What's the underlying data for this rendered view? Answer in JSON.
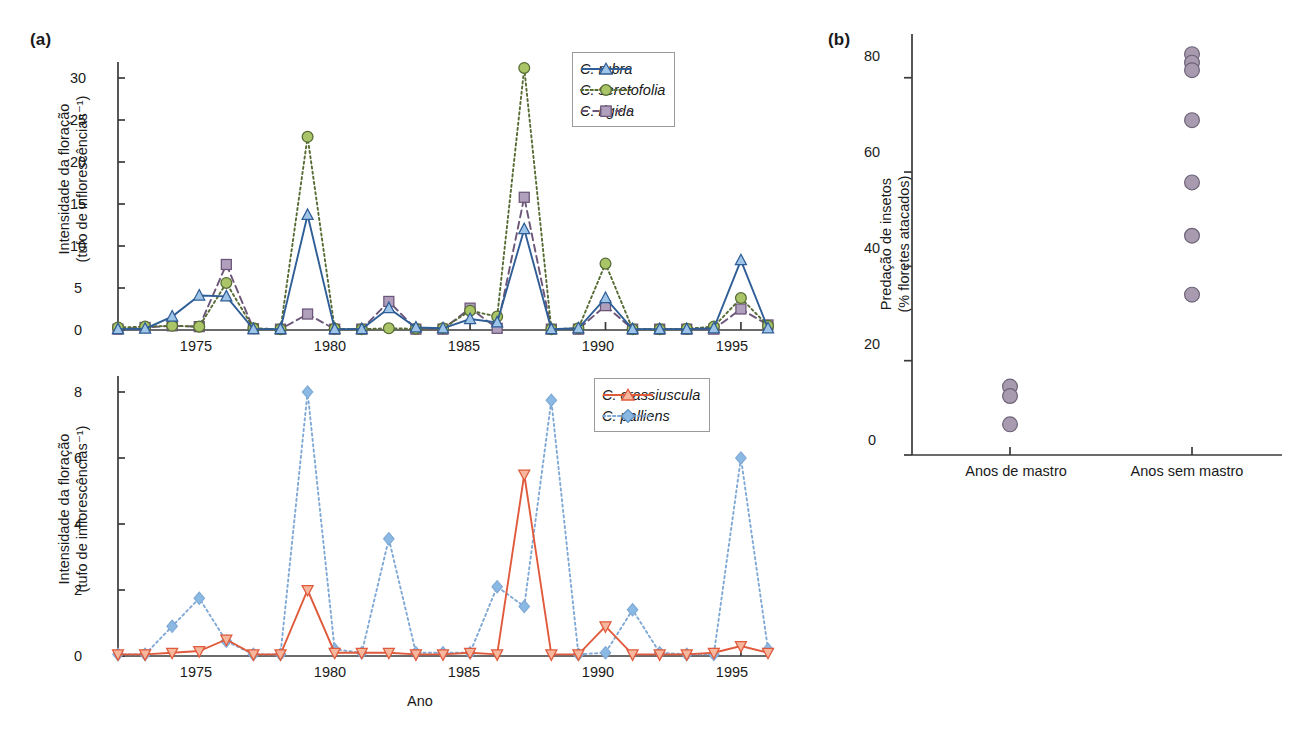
{
  "figure": {
    "panel_a_tag": "(a)",
    "panel_b_tag": "(b)"
  },
  "panel_a_top": {
    "ylabel_line1": "Intensidade da floração",
    "ylabel_line2": "(tufo de inflorescências⁻¹)",
    "yticks": [
      "0",
      "5",
      "10",
      "15",
      "20",
      "25",
      "30"
    ],
    "xticks": [
      "1975",
      "1980",
      "1985",
      "1990",
      "1995"
    ],
    "legend": [
      {
        "label": "C. rubra",
        "key": "line-solid-triangle-blue"
      },
      {
        "label": "C. seretofolia",
        "key": "line-dotted-circle-green"
      },
      {
        "label": "C. rigida",
        "key": "line-dashed-square-purple"
      }
    ]
  },
  "panel_a_bottom": {
    "ylabel_line1": "Intensidade da floração",
    "ylabel_line2": "(tufo de inflorescências⁻¹)",
    "yticks": [
      "0",
      "2",
      "4",
      "6",
      "8"
    ],
    "xticks": [
      "1975",
      "1980",
      "1985",
      "1990",
      "1995"
    ],
    "xlabel": "Ano",
    "legend": [
      {
        "label": "C. crassiuscula",
        "key": "line-solid-triangle-orange"
      },
      {
        "label": "C. palliens",
        "key": "line-dotted-diamond-blue"
      }
    ]
  },
  "panel_b": {
    "ylabel_line1": "Predação de insetos",
    "ylabel_line2": "(% floretes atacados)",
    "yticks": [
      "0",
      "20",
      "40",
      "60",
      "80"
    ],
    "xticks": [
      "Anos de mastro",
      "Anos sem mastro"
    ]
  },
  "colors": {
    "rubra_line": "#2f5d96",
    "rubra_marker": "#9ec4e8",
    "seretofolia_line": "#566b33",
    "seretofolia_marker": "#aac468",
    "rigida_line": "#6b5578",
    "rigida_marker": "#b0a0bd",
    "crassiuscula_line": "#e05a3c",
    "crassiuscula_marker": "#f6b79c",
    "palliens_line": "#7fa8d4",
    "palliens_marker": "#8ab9e4",
    "predation_marker": "#a89bb0",
    "axis": "#3a3a3a"
  },
  "chart_data": [
    {
      "id": "panel-a-top",
      "type": "line",
      "title": "",
      "xlabel": "",
      "ylabel": "Intensidade da floração (tufo de inflorescências-1)",
      "xlim": [
        1972,
        1996
      ],
      "ylim": [
        0,
        32
      ],
      "grid": false,
      "legend_position": "top-right",
      "x": [
        1972,
        1973,
        1974,
        1975,
        1976,
        1977,
        1978,
        1979,
        1980,
        1981,
        1982,
        1983,
        1984,
        1985,
        1986,
        1987,
        1988,
        1989,
        1990,
        1991,
        1992,
        1993,
        1994,
        1995,
        1996
      ],
      "series": [
        {
          "name": "C. rubra",
          "values": [
            0.1,
            0.15,
            1.6,
            4.1,
            4.0,
            0.1,
            0.1,
            13.7,
            0.1,
            0.1,
            2.6,
            0.3,
            0.2,
            1.3,
            0.9,
            12.0,
            0.1,
            0.2,
            3.8,
            0.1,
            0.1,
            0.1,
            0.2,
            8.3,
            0.2
          ]
        },
        {
          "name": "C. seretofolia",
          "values": [
            0.3,
            0.4,
            0.5,
            0.4,
            5.6,
            0.2,
            0.1,
            23.0,
            0.15,
            0.1,
            0.2,
            0.15,
            0.2,
            2.3,
            1.6,
            31.2,
            0.1,
            0.2,
            7.9,
            0.1,
            0.1,
            0.15,
            0.4,
            3.8,
            0.5
          ]
        },
        {
          "name": "C. rigida",
          "values": [
            0.1,
            0.3,
            0.5,
            0.4,
            7.8,
            0.15,
            0.1,
            1.9,
            0.1,
            0.1,
            3.4,
            0.1,
            0.1,
            2.6,
            0.2,
            15.8,
            0.1,
            0.1,
            2.9,
            0.1,
            0.1,
            0.1,
            0.1,
            2.5,
            0.6
          ]
        }
      ]
    },
    {
      "id": "panel-a-bottom",
      "type": "line",
      "title": "",
      "xlabel": "Ano",
      "ylabel": "Intensidade da floração (tufo de inflorescências-1)",
      "xlim": [
        1972,
        1996
      ],
      "ylim": [
        0,
        9
      ],
      "grid": false,
      "legend_position": "top-right",
      "x": [
        1972,
        1973,
        1974,
        1975,
        1976,
        1977,
        1978,
        1979,
        1980,
        1981,
        1982,
        1983,
        1984,
        1985,
        1986,
        1987,
        1988,
        1989,
        1990,
        1991,
        1992,
        1993,
        1994,
        1995,
        1996
      ],
      "series": [
        {
          "name": "C. crassiuscula",
          "values": [
            0.05,
            0.05,
            0.1,
            0.15,
            0.5,
            0.05,
            0.05,
            2.0,
            0.1,
            0.1,
            0.1,
            0.05,
            0.05,
            0.1,
            0.05,
            5.5,
            0.05,
            0.05,
            0.9,
            0.05,
            0.05,
            0.05,
            0.1,
            0.3,
            0.1
          ]
        },
        {
          "name": "C. palliens",
          "values": [
            0.05,
            0.05,
            0.9,
            1.75,
            0.45,
            0.05,
            0.05,
            8.0,
            0.2,
            0.1,
            3.55,
            0.1,
            0.1,
            0.1,
            2.1,
            1.5,
            7.75,
            0.05,
            0.1,
            1.4,
            0.1,
            0.05,
            0.05,
            6.0,
            0.2
          ]
        }
      ]
    },
    {
      "id": "panel-b",
      "type": "scatter",
      "title": "",
      "xlabel": "",
      "ylabel": "Predação de insetos (% floretes atacados)",
      "categories": [
        "Anos de mastro",
        "Anos sem mastro"
      ],
      "ylim": [
        0,
        88
      ],
      "grid": false,
      "legend_position": "none",
      "groups": [
        {
          "name": "Anos de mastro",
          "values": [
            14.5,
            12.5,
            6.5
          ]
        },
        {
          "name": "Anos sem mastro",
          "values": [
            85.0,
            83.2,
            81.6,
            71.0,
            57.8,
            46.5,
            34.0
          ]
        }
      ]
    }
  ]
}
